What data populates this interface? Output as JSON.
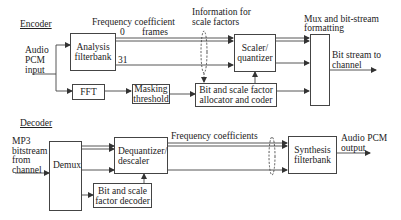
{
  "encoder": {
    "section_label": "Encoder",
    "input_label": "Audio\nPCM\ninput",
    "freq_frames_label": "Frequency coefficient",
    "frames_label": "frames",
    "band_first": "0",
    "band_last": "31",
    "info_label_line1": "Information for",
    "info_label_line2": "scale factors",
    "mux_label_line1": "Mux and bit-stream",
    "mux_label_line2": "formatting",
    "output_label": "Bit stream to\nchannel",
    "blocks": {
      "analysis": "Analysis\nfilterbank",
      "fft": "FFT",
      "masking": "Masking\nthreshold",
      "scaler": "Scaler/\nquantizer",
      "bit_alloc": "Bit and scale factor\nallocator and coder",
      "mux": ""
    }
  },
  "decoder": {
    "section_label": "Decoder",
    "input_label": "MP3\nbitstream\nfrom\nchannel",
    "freq_label": "Frequency coefficients",
    "output_label": "Audio PCM\noutput",
    "blocks": {
      "demux": "Demux",
      "dequantizer": "Dequantizer/\ndescaler",
      "bit_decoder": "Bit and scale\nfactor decoder",
      "synthesis": "Synthesis\nfilterbank"
    }
  },
  "colors": {
    "line": "#444444",
    "text": "#222222",
    "background": "#ffffff"
  }
}
